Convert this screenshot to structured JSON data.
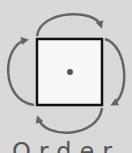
{
  "diagram": {
    "colors": {
      "background": "#d9d9d9",
      "square_fill": "#f8f8f8",
      "square_stroke": "#111111",
      "arrow": "#666666",
      "center_dot": "#555555"
    },
    "caption": "Order 4"
  }
}
